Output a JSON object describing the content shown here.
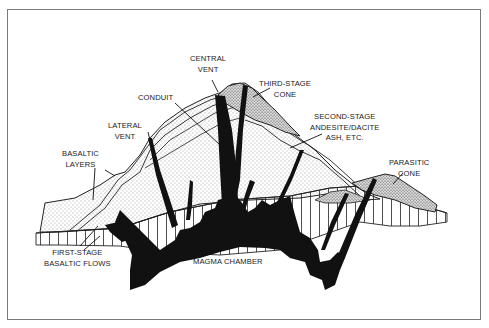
{
  "diagram": {
    "labels": {
      "central_vent": [
        "CENTRAL",
        "VENT"
      ],
      "third_stage_cone": [
        "THIRD-STAGE",
        "CONE"
      ],
      "conduit": [
        "CONDUIT"
      ],
      "lateral_vent": [
        "LATERAL",
        "VENT"
      ],
      "second_stage": [
        "SECOND-STAGE",
        "ANDESITE/DACITE",
        "ASH, ETC."
      ],
      "basaltic_layers": [
        "BASALTIC",
        "LAYERS"
      ],
      "parasitic_cone": [
        "PARASITIC",
        "CONE"
      ],
      "first_stage": [
        "FIRST-STAGE",
        "BASALTIC FLOWS"
      ],
      "magma_chamber": [
        "MAGMA CHAMBER"
      ]
    },
    "colors": {
      "ink": "#111111",
      "frame": "#7a7a7a",
      "background": "#ffffff"
    }
  }
}
